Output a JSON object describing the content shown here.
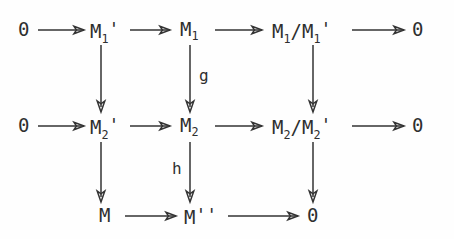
{
  "diagram": {
    "type": "commutative-diagram",
    "background_color": "#fefefe",
    "ink_color": "#2f2f2f",
    "rows": [
      {
        "id": "row-1",
        "nodes": [
          {
            "id": "r1c0",
            "label": "0",
            "base": "0",
            "sub": "",
            "prime": false
          },
          {
            "id": "r1c1",
            "label": "M₁'",
            "base": "M",
            "sub": "1",
            "prime": true
          },
          {
            "id": "r1c2",
            "label": "M₁",
            "base": "M",
            "sub": "1",
            "prime": false
          },
          {
            "id": "r1c3",
            "label": "M₁/M₁'",
            "base": "quotient",
            "sub": "1",
            "prime": true
          },
          {
            "id": "r1c4",
            "label": "0",
            "base": "0",
            "sub": "",
            "prime": false
          }
        ]
      },
      {
        "id": "row-2",
        "nodes": [
          {
            "id": "r2c0",
            "label": "0",
            "base": "0",
            "sub": "",
            "prime": false
          },
          {
            "id": "r2c1",
            "label": "M₂'",
            "base": "M",
            "sub": "2",
            "prime": true
          },
          {
            "id": "r2c2",
            "label": "M₂",
            "base": "M",
            "sub": "2",
            "prime": false
          },
          {
            "id": "r2c3",
            "label": "M₂/M₂'",
            "base": "quotient",
            "sub": "2",
            "prime": true
          },
          {
            "id": "r2c4",
            "label": "0",
            "base": "0",
            "sub": "",
            "prime": false
          }
        ]
      },
      {
        "id": "row-3",
        "nodes": [
          {
            "id": "r3c1",
            "label": "M",
            "base": "M",
            "sub": "",
            "prime": false
          },
          {
            "id": "r3c2",
            "label": "M''",
            "base": "M",
            "sub": "",
            "prime": false
          },
          {
            "id": "r3c3",
            "label": "0",
            "base": "0",
            "sub": "",
            "prime": false
          }
        ]
      }
    ],
    "node_text": {
      "zero": "0",
      "M": "M",
      "slash": "/",
      "prime_mark": "'",
      "double_prime": "''",
      "sub_1": "1",
      "sub_2": "2"
    },
    "map_labels": [
      {
        "id": "label-g",
        "text": "g",
        "column": 2,
        "between_rows": "1-2",
        "side": "right"
      },
      {
        "id": "label-h",
        "text": "h",
        "column": 2,
        "between_rows": "2-3",
        "side": "left"
      }
    ],
    "arrow_count": {
      "horizontal": 12,
      "vertical": 6
    }
  }
}
